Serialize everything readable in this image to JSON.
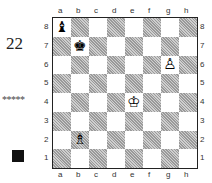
{
  "puzzle_number": "22",
  "rating": "*****",
  "to_move": "black",
  "files": [
    "a",
    "b",
    "c",
    "d",
    "e",
    "f",
    "g",
    "h"
  ],
  "ranks": [
    "8",
    "7",
    "6",
    "5",
    "4",
    "3",
    "2",
    "1"
  ],
  "pieces": [
    {
      "square": "a8",
      "piece": "black-bishop",
      "glyph": "♝"
    },
    {
      "square": "b7",
      "piece": "black-king",
      "glyph": "♚"
    },
    {
      "square": "g6",
      "piece": "white-pawn",
      "glyph": "♙"
    },
    {
      "square": "e4",
      "piece": "white-king",
      "glyph": "♔"
    },
    {
      "square": "b2",
      "piece": "white-bishop",
      "glyph": "♗"
    }
  ]
}
